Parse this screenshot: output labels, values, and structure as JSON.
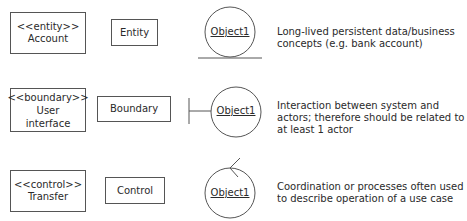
{
  "rows": [
    {
      "stereotype_box": {
        "stereotype": "<<entity>>",
        "name": "Account"
      },
      "icon_box": {
        "label": "Entity"
      },
      "object": {
        "label": "Object1",
        "symbol": "entity-circle-with-underline"
      },
      "description": "Long-lived persistent data/business concepts (e.g. bank account)"
    },
    {
      "stereotype_box": {
        "stereotype": "<<boundary>>",
        "name": "User interface"
      },
      "icon_box": {
        "label": "Boundary"
      },
      "object": {
        "label": "Object1",
        "symbol": "boundary-circle-with-bar"
      },
      "description": "Interaction between system and actors; therefore should be related to at least 1 actor"
    },
    {
      "stereotype_box": {
        "stereotype": "<<control>>",
        "name": "Transfer"
      },
      "icon_box": {
        "label": "Control"
      },
      "object": {
        "label": "Object1",
        "symbol": "control-circle-with-arrow"
      },
      "description": "Coordination or processes often used to describe operation of a use case"
    }
  ],
  "colors": {
    "stroke": "#555555",
    "text": "#2a2a2a",
    "background": "#ffffff"
  }
}
